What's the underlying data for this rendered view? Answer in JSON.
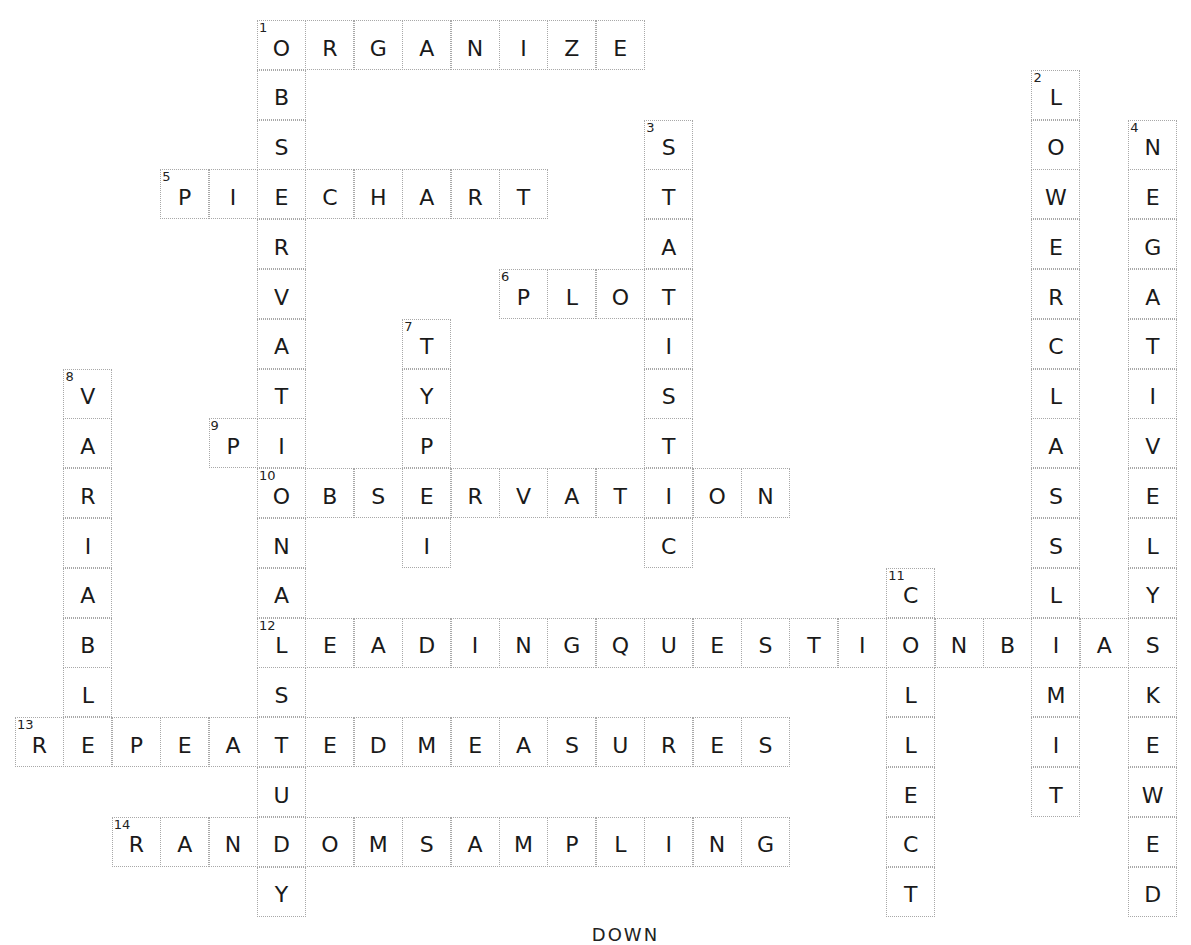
{
  "puzzle": {
    "grid_origin": {
      "left": 15,
      "top": 20
    },
    "cell_size": {
      "width": 48.4,
      "height": 49.8
    },
    "words": [
      {
        "number": "1",
        "answer": "ORGANIZE",
        "direction": "across",
        "row": 0,
        "col": 5
      },
      {
        "number": "1",
        "answer": "OBSERVATIONALSTUDY",
        "direction": "down",
        "row": 0,
        "col": 5
      },
      {
        "number": "2",
        "answer": "LOWERCLASSLIMIT",
        "direction": "down",
        "row": 1,
        "col": 21
      },
      {
        "number": "3",
        "answer": "STATISTIC",
        "direction": "down",
        "row": 2,
        "col": 13
      },
      {
        "number": "4",
        "answer": "NEGATIVELYSKEWED",
        "direction": "down",
        "row": 2,
        "col": 23
      },
      {
        "number": "5",
        "answer": "PIECHART",
        "direction": "across",
        "row": 3,
        "col": 3
      },
      {
        "number": "6",
        "answer": "PLOT",
        "direction": "across",
        "row": 5,
        "col": 10
      },
      {
        "number": "7",
        "answer": "TYPEI",
        "direction": "down",
        "row": 6,
        "col": 8
      },
      {
        "number": "8",
        "answer": "VARIABLE",
        "direction": "down",
        "row": 7,
        "col": 1
      },
      {
        "number": "9",
        "answer": "PI",
        "direction": "across",
        "row": 8,
        "col": 4
      },
      {
        "number": "10",
        "answer": "OBSERVATION",
        "direction": "across",
        "row": 9,
        "col": 5
      },
      {
        "number": "11",
        "answer": "COLLECT",
        "direction": "down",
        "row": 11,
        "col": 18
      },
      {
        "number": "12",
        "answer": "LEADINGQUESTIONBIAS",
        "direction": "across",
        "row": 12,
        "col": 5
      },
      {
        "number": "13",
        "answer": "REPEATEDMEASURES",
        "direction": "across",
        "row": 14,
        "col": 0
      },
      {
        "number": "14",
        "answer": "RANDOMSAMPLING",
        "direction": "across",
        "row": 16,
        "col": 2
      }
    ]
  },
  "footer": {
    "heading": "DOWN"
  }
}
